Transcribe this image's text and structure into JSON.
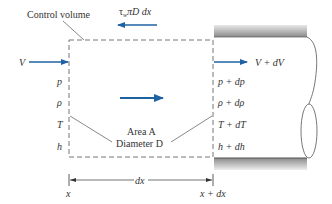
{
  "diagram": {
    "colors": {
      "arrow": "#1f62a3",
      "line": "#555555",
      "text": "#333333",
      "wall_top": "#8a8a8a",
      "wall_light": "#e6e6e6"
    },
    "labels": {
      "control_volume": "Control volume",
      "shear": "τwπD dx",
      "shear_main": "τ",
      "shear_sub": "w",
      "shear_rest": "πD dx",
      "inlet_velocity": "V",
      "outlet_velocity": "V + dV",
      "area": "Area A",
      "diameter": "Diameter D",
      "dx": "dx",
      "x_left": "x",
      "x_right": "x + dx"
    },
    "inlet_properties": [
      "p",
      "ρ",
      "T",
      "h"
    ],
    "outlet_properties": [
      "p + dp",
      "ρ + dρ",
      "T + dT",
      "h + dh"
    ]
  }
}
